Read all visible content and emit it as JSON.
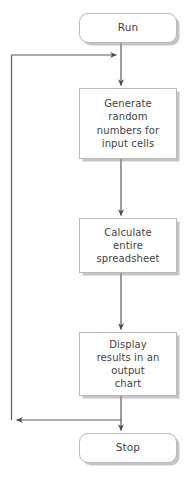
{
  "diagram": {
    "orientation": "vertical",
    "colors": {
      "background": "#ffffff",
      "node_fill": "#ffffff",
      "node_border": "#b9b9b9",
      "text": "#3f3f3f",
      "connector": "#5a5a5a",
      "shadow": "#969696"
    },
    "nodes": [
      {
        "id": "run",
        "shape": "terminator",
        "label": "Run"
      },
      {
        "id": "generate",
        "shape": "process",
        "label": "Generate\nrandom\nnumbers for\ninput cells"
      },
      {
        "id": "calculate",
        "shape": "process",
        "label": "Calculate\nentire\nspreadsheet"
      },
      {
        "id": "display",
        "shape": "process",
        "label": "Display\nresults in an\noutput\nchart"
      },
      {
        "id": "stop",
        "shape": "terminator",
        "label": "Stop"
      }
    ],
    "edges": [
      {
        "id": "run-to-generate",
        "from": "run",
        "to": "generate",
        "label": ""
      },
      {
        "id": "generate-to-calculate",
        "from": "generate",
        "to": "calculate",
        "label": ""
      },
      {
        "id": "calculate-to-display",
        "from": "calculate",
        "to": "display",
        "label": ""
      },
      {
        "id": "display-to-stop",
        "from": "display",
        "to": "stop",
        "label": ""
      },
      {
        "id": "loop-back",
        "from": "display",
        "to": "generate",
        "label": ""
      }
    ]
  }
}
